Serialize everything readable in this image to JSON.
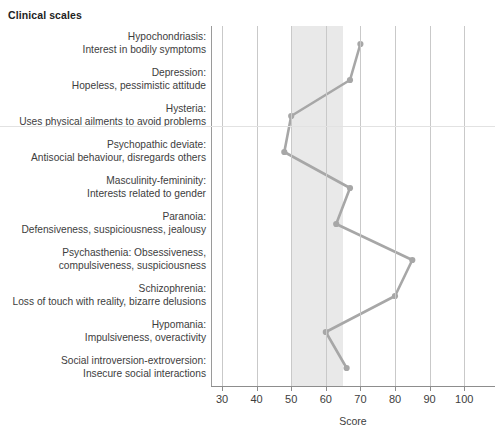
{
  "title": "Clinical scales",
  "axis": {
    "x_title": "Score",
    "ticks": [
      30,
      40,
      50,
      60,
      70,
      80,
      90,
      100
    ]
  },
  "colors": {
    "line": "#a7a7a7",
    "grid": "#c9c9c9",
    "band": "#e9e9e9",
    "text": "#3d3d3d"
  },
  "scales": [
    {
      "name": "Hypochondriasis:",
      "desc": "Interest in bodily symptoms",
      "score": 70
    },
    {
      "name": "Depression:",
      "desc": "Hopeless, pessimistic attitude",
      "score": 67
    },
    {
      "name": "Hysteria:",
      "desc": "Uses physical ailments to avoid problems",
      "score": 50
    },
    {
      "name": "Psychopathic deviate:",
      "desc": "Antisocial behaviour, disregards others",
      "score": 48
    },
    {
      "name": "Masculinity-femininity:",
      "desc": "Interests related to gender",
      "score": 67
    },
    {
      "name": "Paranoia:",
      "desc": "Defensiveness, suspiciousness, jealousy",
      "score": 63
    },
    {
      "name": "Psychasthenia: Obsessiveness,",
      "desc": "compulsiveness, suspiciousness",
      "score": 85
    },
    {
      "name": "Schizophrenia:",
      "desc": "Loss of touch with reality, bizarre delusions",
      "score": 80
    },
    {
      "name": "Hypomania:",
      "desc": "Impulsiveness, overactivity",
      "score": 60
    },
    {
      "name": "Social introversion-extroversion:",
      "desc": "Insecure social interactions",
      "score": 66
    }
  ],
  "chart_data": {
    "type": "line",
    "title": "Clinical scales",
    "xlabel": "Score",
    "ylabel": "",
    "xlim": [
      27,
      103
    ],
    "grid": true,
    "legend": "none",
    "orientation": "horizontal-categories-on-y",
    "shaded_band": {
      "from": 50,
      "to": 65,
      "color": "#e9e9e9"
    },
    "categories": [
      "Hypochondriasis: Interest in bodily symptoms",
      "Depression: Hopeless, pessimistic attitude",
      "Hysteria: Uses physical ailments to avoid problems",
      "Psychopathic deviate: Antisocial behaviour, disregards others",
      "Masculinity-femininity: Interests related to gender",
      "Paranoia: Defensiveness, suspiciousness, jealousy",
      "Psychasthenia: Obsessiveness, compulsiveness, suspiciousness",
      "Schizophrenia: Loss of touch with reality, bizarre delusions",
      "Hypomania: Impulsiveness, overactivity",
      "Social introversion-extroversion: Insecure social interactions"
    ],
    "values": [
      70,
      67,
      50,
      48,
      67,
      63,
      85,
      80,
      60,
      66
    ],
    "xticks": [
      30,
      40,
      50,
      60,
      70,
      80,
      90,
      100
    ]
  }
}
